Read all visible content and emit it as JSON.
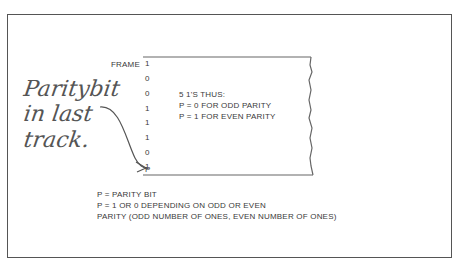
{
  "diagram": {
    "frame_label": "FRAME",
    "bits": [
      "1",
      "0",
      "0",
      "1",
      "1",
      "1",
      "0",
      "1",
      "P"
    ],
    "count_note": "5 1'S THUS:",
    "rule_odd": "P = 0 FOR ODD PARITY",
    "rule_even": "P = 1 FOR EVEN PARITY",
    "handwritten_note": [
      "Paritybit",
      "in last",
      "track."
    ],
    "legend": [
      "P = PARITY BIT",
      "P = 1 OR 0 DEPENDING ON ODD OR EVEN",
      "PARITY (ODD NUMBER OF ONES, EVEN NUMBER OF ONES)"
    ],
    "colors": {
      "line": "#555555",
      "text": "#3a3a3a",
      "background": "#ffffff"
    }
  }
}
